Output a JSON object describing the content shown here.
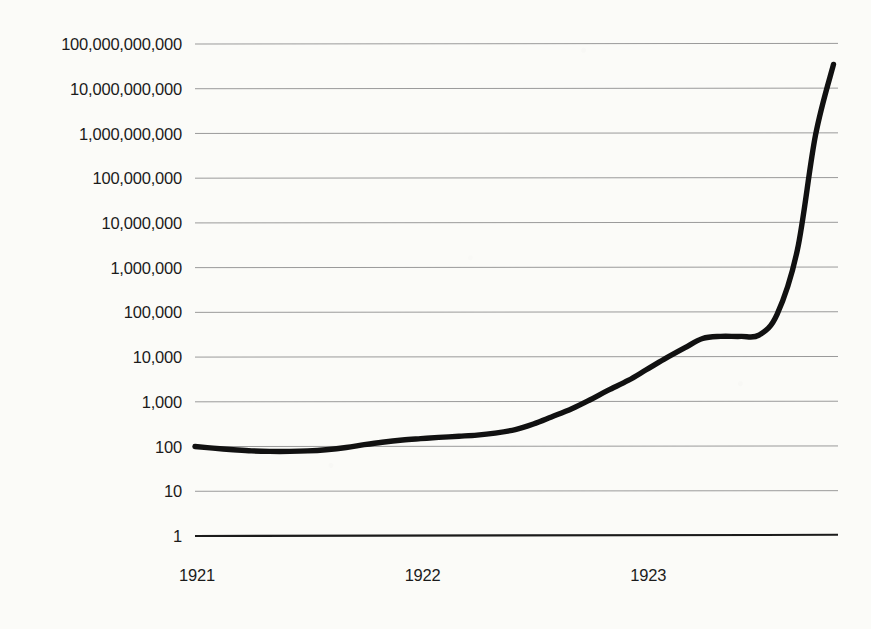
{
  "chart_data": {
    "type": "line",
    "title": "",
    "subtitle": "",
    "xlabel": "",
    "ylabel": "",
    "yscale": "log",
    "ylim": [
      1,
      100000000000
    ],
    "grid": true,
    "legend": false,
    "legend_position": "none",
    "line_color": "#111111",
    "grid_color": "#9a9a9a",
    "background_color": "#fbfbf8",
    "axis_color": "#1b1b1b",
    "y_tick_labels": [
      "100,000,000,000",
      "10,000,000,000",
      "1,000,000,000",
      "100,000,000",
      "10,000,000",
      "1,000,000",
      "100,000",
      "10,000",
      "1,000",
      "100",
      "10",
      "1"
    ],
    "y_tick_values": [
      100000000000,
      10000000000,
      1000000000,
      100000000,
      10000000,
      1000000,
      100000,
      10000,
      1000,
      100,
      10,
      1
    ],
    "x_tick_labels": [
      "1921",
      "1922",
      "1923"
    ],
    "x_tick_values": [
      1921,
      1922,
      1923
    ],
    "xlim": [
      1921,
      1923.85
    ],
    "series": [
      {
        "name": "Price index",
        "x": [
          1921.0,
          1921.08,
          1921.17,
          1921.25,
          1921.33,
          1921.42,
          1921.5,
          1921.58,
          1921.67,
          1921.75,
          1921.83,
          1921.92,
          1922.0,
          1922.08,
          1922.17,
          1922.25,
          1922.33,
          1922.42,
          1922.5,
          1922.58,
          1922.67,
          1922.75,
          1922.83,
          1922.92,
          1923.0,
          1923.08,
          1923.17,
          1923.25,
          1923.33,
          1923.42,
          1923.5,
          1923.58,
          1923.67,
          1923.75,
          1923.83
        ],
        "y": [
          100,
          92,
          85,
          80,
          78,
          78,
          80,
          85,
          95,
          110,
          125,
          140,
          150,
          160,
          170,
          180,
          200,
          240,
          320,
          460,
          700,
          1100,
          1800,
          3000,
          5200,
          9000,
          16000,
          26000,
          29000,
          29000,
          31000,
          90000,
          2500000,
          900000000,
          35000000000
        ]
      }
    ],
    "annotations": []
  }
}
